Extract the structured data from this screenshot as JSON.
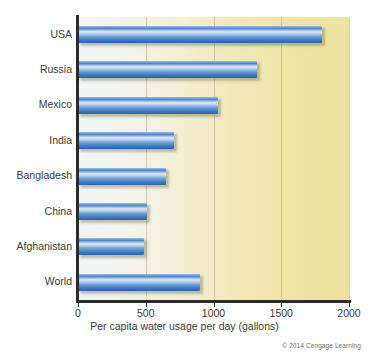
{
  "chart_data": {
    "type": "bar",
    "orientation": "horizontal",
    "title": "",
    "xlabel": "Per capita water usage per day (gallons)",
    "ylabel": "",
    "categories": [
      "USA",
      "Russia",
      "Mexico",
      "India",
      "Bangladesh",
      "China",
      "Afghanistan",
      "World"
    ],
    "values": [
      1800,
      1320,
      1030,
      710,
      650,
      510,
      490,
      900
    ],
    "xlim": [
      0,
      2000
    ],
    "xticks": [
      0,
      500,
      1000,
      1500,
      2000
    ],
    "xtick_labels": [
      "0",
      "500",
      "1000",
      "1500",
      "2000"
    ],
    "grid": "vertical",
    "legend": "none",
    "bar_color": "#4f86c8",
    "plot_background_left": "#f2f6f7",
    "plot_background_right": "#efe3a0",
    "axis_color": "#2b2b2b"
  },
  "credit": "© 2014 Cengage Learning"
}
